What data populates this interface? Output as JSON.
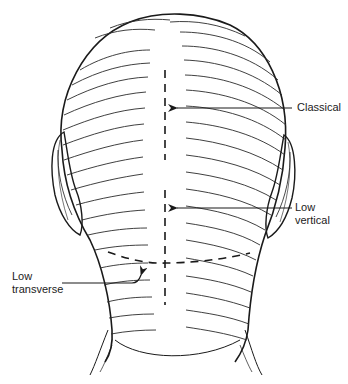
{
  "diagram": {
    "colors": {
      "ink": "#1a1a1a",
      "background": "#ffffff",
      "label": "#222222"
    },
    "labels": {
      "classical": "Classical",
      "low_vertical_line1": "Low",
      "low_vertical_line2": "vertical",
      "low_transverse_line1": "Low",
      "low_transverse_line2": "transverse"
    },
    "incisions": [
      {
        "name": "Classical",
        "type": "vertical-dashed",
        "from": [
          165,
          70
        ],
        "to": [
          165,
          160
        ]
      },
      {
        "name": "Low vertical",
        "type": "vertical-dashed",
        "from": [
          165,
          190
        ],
        "to": [
          165,
          305
        ]
      },
      {
        "name": "Low transverse",
        "type": "curved-dashed",
        "from": [
          105,
          255
        ],
        "to": [
          250,
          258
        ]
      }
    ]
  }
}
